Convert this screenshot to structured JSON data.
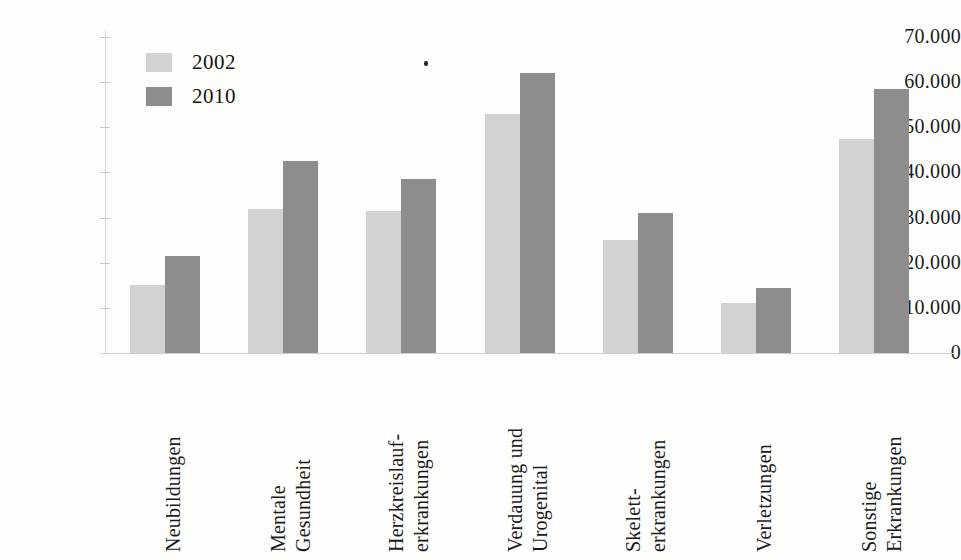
{
  "chart_data": {
    "type": "bar",
    "title": "",
    "subtitle": "",
    "xlabel": "",
    "ylabel": "",
    "ylim": [
      0,
      70000
    ],
    "y_ticks": [
      "0",
      "10.000",
      "20.000",
      "30.000",
      "40.000",
      "50.000",
      "60.000",
      "70.000"
    ],
    "y_tick_values": [
      0,
      10000,
      20000,
      30000,
      40000,
      50000,
      60000,
      70000
    ],
    "grid": false,
    "legend_position": "top-left-inside",
    "categories": [
      "Neubildungen",
      "Mentale Gesundheit",
      "Herzkreislauf-erkrankungen",
      "Verdauung und Urogenital",
      "Skelett-erkrankungen",
      "Verletzungen",
      "Sonstige Erkrankungen"
    ],
    "category_lines": [
      [
        "Neubildungen"
      ],
      [
        "Mentale",
        "Gesundheit"
      ],
      [
        "Herzkreislauf-",
        "erkrankungen"
      ],
      [
        "Verdauung und",
        "Urogenital"
      ],
      [
        "Skelett-",
        "erkrankungen"
      ],
      [
        "Verletzungen"
      ],
      [
        "Sonstige",
        "Erkrankungen"
      ]
    ],
    "series": [
      {
        "name": "2002",
        "color": "#d2d2d2",
        "values": [
          15000,
          32000,
          31500,
          53000,
          25000,
          11000,
          47500
        ]
      },
      {
        "name": "2010",
        "color": "#8d8d8d",
        "values": [
          21500,
          42500,
          38500,
          62000,
          31000,
          14500,
          58500
        ]
      }
    ]
  },
  "legend": {
    "items": [
      {
        "label": "2002",
        "color": "#d2d2d2"
      },
      {
        "label": "2010",
        "color": "#8d8d8d"
      }
    ]
  },
  "axis": {
    "baseline_color": "#cfcfcb",
    "axis_line_color": "#d9d9d6"
  }
}
